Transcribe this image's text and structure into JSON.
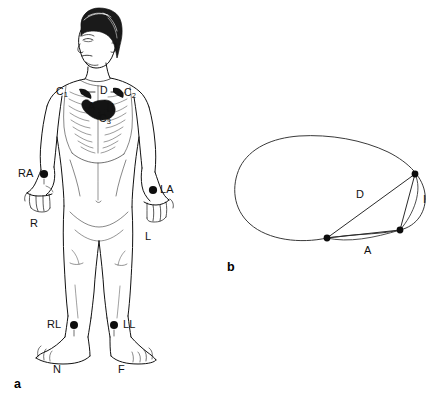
{
  "figure": {
    "caption_panels": [
      "a",
      "b"
    ],
    "ink_color": "#111111",
    "background_color": "#ffffff"
  },
  "panel_a": {
    "panel_label": "a",
    "description": "Anterior view line drawing of a standing human figure with ECG electrode sites marked",
    "chest_electrodes": [
      {
        "id": "c1",
        "label": "C",
        "subscript": "1",
        "x": 62,
        "y": 92
      },
      {
        "id": "d",
        "label": "D",
        "subscript": "",
        "x": 104,
        "y": 91
      },
      {
        "id": "c2",
        "label": "C",
        "subscript": "2",
        "x": 130,
        "y": 93
      },
      {
        "id": "a",
        "label": "A",
        "subscript": "",
        "x": 92,
        "y": 107
      },
      {
        "id": "i",
        "label": "I",
        "subscript": "",
        "x": 113,
        "y": 108
      },
      {
        "id": "c3",
        "label": "C",
        "subscript": "3",
        "x": 105,
        "y": 119
      }
    ],
    "limb_electrodes": [
      {
        "id": "ra",
        "label": "RA",
        "dot_x": 44,
        "dot_y": 174,
        "label_x": 18,
        "label_y": 169
      },
      {
        "id": "la",
        "label": "LA",
        "dot_x": 153,
        "dot_y": 190,
        "label_x": 161,
        "label_y": 185
      },
      {
        "id": "rl",
        "label": "RL",
        "dot_x": 74,
        "dot_y": 325,
        "label_x": 47,
        "label_y": 320
      },
      {
        "id": "ll",
        "label": "LL",
        "dot_x": 114,
        "dot_y": 325,
        "label_x": 123,
        "label_y": 320
      }
    ],
    "limb_designations": [
      {
        "id": "r",
        "label": "R",
        "x": 33,
        "y": 219
      },
      {
        "id": "l",
        "label": "L",
        "x": 147,
        "y": 232
      },
      {
        "id": "n",
        "label": "N",
        "x": 56,
        "y": 365
      },
      {
        "id": "f",
        "label": "F",
        "x": 121,
        "y": 365
      }
    ]
  },
  "panel_b": {
    "panel_label": "b",
    "description": "Transverse torso cross-section with three electrode points joined by lead vector chords",
    "vertices": [
      {
        "id": "left-anterior",
        "x": 327,
        "y": 238
      },
      {
        "id": "right-superior",
        "x": 415,
        "y": 174
      },
      {
        "id": "right-inferior",
        "x": 400,
        "y": 230
      }
    ],
    "lead_labels": [
      {
        "id": "d",
        "label": "D",
        "x": 358,
        "y": 190
      },
      {
        "id": "i",
        "label": "I",
        "x": 424,
        "y": 195
      },
      {
        "id": "a",
        "label": "A",
        "x": 366,
        "y": 246
      }
    ]
  }
}
